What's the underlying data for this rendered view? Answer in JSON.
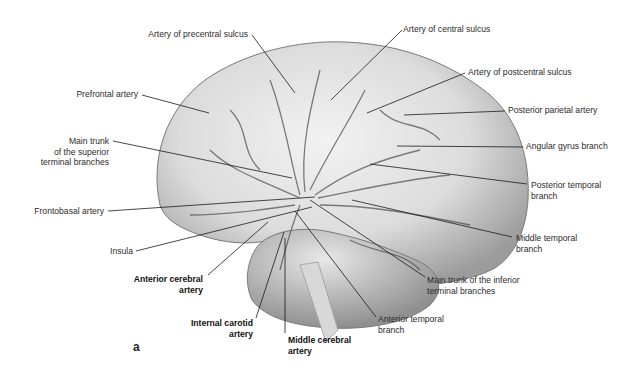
{
  "figure": {
    "panel_letter": "a",
    "colors": {
      "brain_fill": "#e6e6e6",
      "brain_shadow": "#9a9a9a",
      "vessel": "#3a3a3a",
      "leader": "#1a1a1a",
      "text": "#2b2b2b"
    },
    "labels": {
      "precentral": "Artery of precentral sulcus",
      "central": "Artery of central sulcus",
      "postcentral": "Artery of postcentral sulcus",
      "prefrontal": "Prefrontal artery",
      "post_parietal": "Posterior parietal artery",
      "sup_trunk_1": "Main trunk",
      "sup_trunk_2": "of the superior",
      "sup_trunk_3": "terminal branches",
      "angular": "Angular gyrus branch",
      "post_temporal_1": "Posterior temporal",
      "post_temporal_2": "branch",
      "frontobasal": "Frontobasal artery",
      "mid_temporal_1": "Middle temporal",
      "mid_temporal_2": "branch",
      "insula": "Insula",
      "aca_1": "Anterior cerebral",
      "aca_2": "artery",
      "inf_trunk_1": "Main trunk of the inferior",
      "inf_trunk_2": "terminal branches",
      "ant_temporal_1": "Anterior temporal",
      "ant_temporal_2": "branch",
      "ica_1": "Internal carotid",
      "ica_2": "artery",
      "mca_1": "Middle cerebral",
      "mca_2": "artery"
    }
  }
}
